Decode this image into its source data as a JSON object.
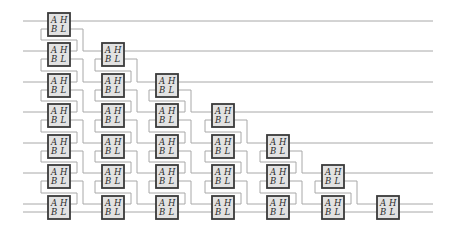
{
  "diagram": {
    "type": "sorting-network",
    "rows": 7,
    "columns": 7,
    "cell_labels": {
      "top_left": "A",
      "top_right": "H",
      "bottom_left": "B",
      "bottom_right": "L"
    },
    "column_x": [
      48,
      102,
      156,
      212,
      267,
      322,
      377
    ],
    "row_y": [
      13,
      43,
      74,
      104,
      135,
      165,
      196
    ],
    "cell_width": 22,
    "cell_height": 23,
    "input_x": 23,
    "output_x": 433,
    "colors": {
      "wire": "#a8a8a8",
      "cell_fill": "#e2e2e2",
      "cell_border": "#3a3a3a",
      "label": "#2a2a2a"
    },
    "inputs": [
      {
        "row": 0,
        "port": "A"
      },
      {
        "row": 1,
        "port": "A"
      },
      {
        "row": 2,
        "port": "A"
      },
      {
        "row": 3,
        "port": "A"
      },
      {
        "row": 4,
        "port": "A"
      },
      {
        "row": 5,
        "port": "A"
      },
      {
        "row": 6,
        "port": "A"
      },
      {
        "row": 6,
        "port": "B"
      }
    ],
    "outputs": [
      {
        "row": 0,
        "column": 0,
        "port": "H"
      },
      {
        "row": 1,
        "column": 1,
        "port": "H"
      },
      {
        "row": 2,
        "column": 2,
        "port": "H"
      },
      {
        "row": 3,
        "column": 3,
        "port": "H"
      },
      {
        "row": 4,
        "column": 4,
        "port": "H"
      },
      {
        "row": 5,
        "column": 5,
        "port": "H"
      },
      {
        "row": 6,
        "column": 6,
        "port": "H"
      },
      {
        "row": 6,
        "column": 6,
        "port": "L"
      }
    ]
  }
}
